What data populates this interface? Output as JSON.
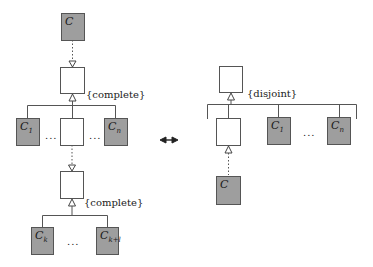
{
  "left_diagram": {
    "top_class": {
      "label": "C",
      "fill": "gray"
    },
    "upper_parent": {
      "label": "",
      "fill": "white"
    },
    "upper_constraint": "{complete}",
    "upper_children": [
      {
        "label": "C",
        "sub": "1",
        "fill": "gray"
      },
      {
        "label": "",
        "sub": "",
        "fill": "white"
      },
      {
        "label": "C",
        "sub": "n",
        "fill": "gray"
      }
    ],
    "upper_ellipsis_left": "...",
    "upper_ellipsis_right": "...",
    "lower_parent": {
      "label": "",
      "fill": "white"
    },
    "lower_constraint": "{complete}",
    "lower_children": [
      {
        "label": "C",
        "sub": "k",
        "fill": "gray"
      },
      {
        "label": "C",
        "sub": "k+l",
        "fill": "gray"
      }
    ],
    "lower_ellipsis": "..."
  },
  "equivalence_symbol": "double-arrow",
  "right_diagram": {
    "parent": {
      "label": "",
      "fill": "white"
    },
    "constraint": "{disjoint}",
    "children": [
      {
        "label": "",
        "sub": "",
        "fill": "white"
      },
      {
        "label": "C",
        "sub": "1",
        "fill": "gray"
      },
      {
        "label": "C",
        "sub": "n",
        "fill": "gray"
      }
    ],
    "ellipsis": "...",
    "bottom_class": {
      "label": "C",
      "fill": "gray"
    }
  },
  "colors": {
    "gray_fill": "#9e9e9e",
    "line": "#555555",
    "background": "#ffffff"
  }
}
